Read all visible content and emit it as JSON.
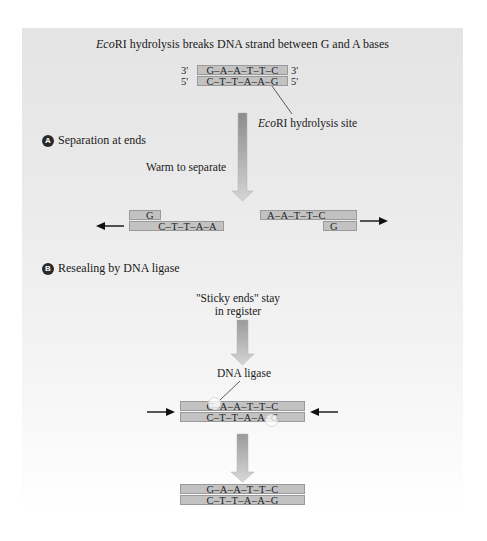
{
  "title": {
    "italic": "Eco",
    "rest": "RI hydrolysis breaks DNA strand between G and A bases"
  },
  "initial": {
    "top_strand": "G–A–A–T–T–C",
    "bottom_strand": "C–T–T–A–A–G",
    "top_left_end": "3'",
    "top_right_end": "3'",
    "bottom_left_end": "5'",
    "bottom_right_end": "5'",
    "site_label": {
      "italic": "Eco",
      "rest": "RI hydrolysis site"
    }
  },
  "step_a": {
    "badge": "A",
    "label": "Separation at ends",
    "action": "Warm to separate",
    "left_fragment": {
      "top": "G",
      "bottom": "C–T–T–A–A"
    },
    "right_fragment": {
      "top": "A–A–T–T–C",
      "bottom": "G"
    }
  },
  "step_b": {
    "badge": "B",
    "label": "Resealing by DNA ligase",
    "note_line1": "\"Sticky ends\" stay",
    "note_line2": "in register",
    "enzyme_label": "DNA ligase",
    "ligating": {
      "top": "G–A–A–T–T–C",
      "bottom": "C–T–T–A–A–G"
    },
    "sealed": {
      "top": "G–A–A–T–T–C",
      "bottom": "C–T–T–A–A–G"
    }
  },
  "colors": {
    "strand_fill": "#c2c2c2",
    "strand_border": "#9a9a9a",
    "arrow_dark": "#8c8c8c",
    "arrow_light": "#cfcfcf",
    "panel_top": "#e4e4e4"
  }
}
